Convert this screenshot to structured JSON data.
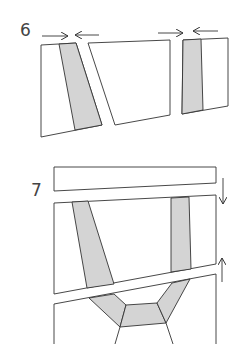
{
  "steps": [
    {
      "number": "6",
      "description": "Pieces pushed together horizontally"
    },
    {
      "number": "7",
      "description": "Strips pushed together vertically"
    }
  ],
  "colors": {
    "line": "#333333",
    "fill": "#d4d4d4",
    "background": "#ffffff",
    "text": "#444444"
  }
}
